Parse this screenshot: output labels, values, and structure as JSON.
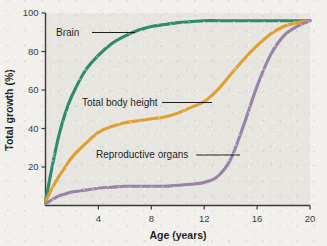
{
  "chart_data": {
    "type": "line",
    "title": "",
    "xlabel": "Age (years)",
    "ylabel": "Total growth (%)",
    "xlim": [
      0,
      20
    ],
    "ylim": [
      0,
      100
    ],
    "xticks": [
      4,
      8,
      12,
      16,
      20
    ],
    "yticks": [
      20,
      40,
      60,
      80,
      100
    ],
    "xtick_labels": [
      "4",
      "8",
      "12",
      "16",
      "20"
    ],
    "ytick_labels": [
      "20",
      "40",
      "60",
      "80",
      "100"
    ],
    "grid": false,
    "legend_position": "inline-annotations",
    "background_color": "#e7e5df",
    "series": [
      {
        "name": "Brain",
        "color": "#2e8b6b",
        "label_color": "#1c1c1c",
        "x": [
          0,
          0.5,
          1,
          1.5,
          2,
          3,
          4,
          5,
          6,
          7,
          8,
          9,
          10,
          11,
          12,
          13,
          14,
          15,
          16,
          17,
          18,
          19,
          20
        ],
        "values": [
          2,
          20,
          36,
          48,
          57,
          70,
          78,
          84,
          88,
          91,
          93,
          94,
          95,
          95.5,
          96,
          96,
          96,
          96,
          96,
          96,
          96,
          96,
          96
        ]
      },
      {
        "name": "Total body height",
        "color": "#e0a030",
        "label_color": "#1c1c1c",
        "x": [
          0,
          0.5,
          1,
          1.5,
          2,
          3,
          4,
          5,
          6,
          7,
          8,
          9,
          10,
          11,
          12,
          13,
          14,
          15,
          16,
          17,
          18,
          19,
          20
        ],
        "values": [
          2,
          9,
          15,
          20,
          25,
          32,
          38,
          41,
          43,
          44,
          45,
          46,
          48,
          51,
          54,
          60,
          68,
          76,
          83,
          89,
          93,
          95,
          96
        ]
      },
      {
        "name": "Reproductive organs",
        "color": "#9b83a8",
        "label_color": "#1c1c1c",
        "x": [
          0,
          0.5,
          1,
          1.5,
          2,
          3,
          4,
          5,
          6,
          7,
          8,
          9,
          10,
          11,
          12,
          13,
          14,
          15,
          16,
          17,
          18,
          19,
          20
        ],
        "values": [
          1,
          3,
          5,
          6,
          7,
          8,
          9,
          9.5,
          10,
          10,
          10,
          10,
          10.5,
          11,
          12,
          15,
          24,
          42,
          62,
          78,
          88,
          93,
          96
        ]
      }
    ],
    "annotations": [
      {
        "text": "Brain",
        "series": "Brain"
      },
      {
        "text": "Total body height",
        "series": "Total body height"
      },
      {
        "text": "Reproductive organs",
        "series": "Reproductive organs"
      }
    ]
  }
}
